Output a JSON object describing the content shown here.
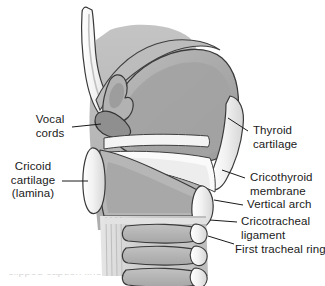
{
  "figure": {
    "background_color": "#ffffff",
    "text_color": "#1a1a1a",
    "leader_line_color": "#1a1a1a",
    "outline_color": "#333333",
    "palette": {
      "cartilage_light": "#f0f0f0",
      "tissue_mid": "#b4b4b4",
      "tissue_dark": "#a0a0a0",
      "tissue_darker": "#8f8f8f",
      "tissue_pale": "#c9c9c9",
      "membrane_white": "#fafafa"
    }
  },
  "labels": {
    "vocal_cords": "Vocal\ncords",
    "cricoid_cartilage": "Cricoid\ncartilage\n(lamina)",
    "thyroid_cartilage": "Thyroid\ncartilage",
    "cricothyroid_membrane": "Cricothyroid\nmembrane",
    "vertical_arch": "Vertical arch",
    "cricotracheal_ligament": "Cricotracheal\nligament",
    "first_tracheal_ring": "First tracheal ring"
  },
  "caption": {
    "clipped_text": "clipped caption line"
  }
}
